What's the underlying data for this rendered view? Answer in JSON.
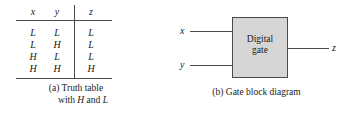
{
  "figure": {
    "background_color": "#ffffff",
    "line_color": "#4a4a4a",
    "text_color": "#1a1a1a"
  },
  "panel_a": {
    "caption_prefix": "(a) Truth table",
    "caption_line2_prefix": "with ",
    "caption_line2_h": "H",
    "caption_line2_mid": " and ",
    "caption_line2_l": "L",
    "table": {
      "headers": [
        "x",
        "y",
        "z"
      ],
      "rows": [
        [
          "L",
          "L",
          "L"
        ],
        [
          "L",
          "H",
          "L"
        ],
        [
          "H",
          "L",
          "L"
        ],
        [
          "H",
          "H",
          "H"
        ]
      ]
    }
  },
  "panel_b": {
    "caption": "(b) Gate block diagram",
    "box": {
      "label_line1": "Digital",
      "label_line2": "gate",
      "fill_color": "#d6d6d6",
      "border_color": "#4a4a4a"
    },
    "inputs": [
      {
        "label": "x"
      },
      {
        "label": "y"
      }
    ],
    "output": {
      "label": "z"
    }
  }
}
